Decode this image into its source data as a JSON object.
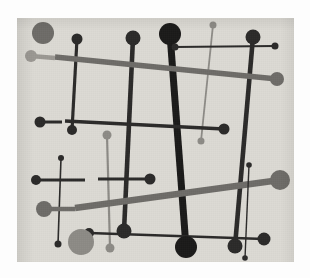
{
  "artwork": {
    "title": "Abstract Composition with Lines and Dots",
    "medium": "print reproduction",
    "style": "geometric-abstract",
    "canvas": {
      "x": 17,
      "y": 18,
      "width": 277,
      "height": 244,
      "background_color": "#dcdad4",
      "page_color": "#fdfdfd"
    },
    "palette": {
      "background": "#dcdad4",
      "dark": "#2b2a29",
      "black": "#1b1a19",
      "mid_gray": "#6e6c68",
      "light_gray": "#8d8b86",
      "pale_gray": "#9b9893",
      "page": "#fdfdfd"
    }
  },
  "chart_data": {
    "type": "scatter",
    "xlabel": "",
    "ylabel": "",
    "xlim": [
      0,
      277
    ],
    "ylim": [
      0,
      244
    ],
    "grid": false,
    "legend": null,
    "note": "Coordinates are in canvas space (origin at canvas top-left).",
    "strokes": [
      {
        "name": "thick-black-diagonal",
        "x1": 153,
        "y1": 16,
        "x2": 169,
        "y2": 229,
        "width": 7,
        "color": "#1b1a19",
        "cap_start": 11,
        "cap_end": 11
      },
      {
        "name": "dark-vertical-left",
        "x1": 60,
        "y1": 21,
        "x2": 55,
        "y2": 112,
        "width": 3.2,
        "color": "#2b2a29",
        "cap_start": 5.5,
        "cap_end": 5
      },
      {
        "name": "dark-vertical-center",
        "x1": 116,
        "y1": 20,
        "x2": 107,
        "y2": 213,
        "width": 4.6,
        "color": "#2b2a29",
        "cap_start": 7.5,
        "cap_end": 7.5
      },
      {
        "name": "dark-vertical-right",
        "x1": 236,
        "y1": 19,
        "x2": 218,
        "y2": 228,
        "width": 4.6,
        "color": "#2b2a29",
        "cap_start": 7.5,
        "cap_end": 7.5
      },
      {
        "name": "gray-vertical-tall",
        "x1": 196,
        "y1": 7,
        "x2": 184,
        "y2": 123,
        "width": 1.8,
        "color": "#8d8b86",
        "cap_start": 3.5,
        "cap_end": 3.5
      },
      {
        "name": "gray-vertical-lower",
        "x1": 90,
        "y1": 117,
        "x2": 93,
        "y2": 230,
        "width": 2.2,
        "color": "#8d8b86",
        "cap_start": 4.5,
        "cap_end": 4.5
      },
      {
        "name": "gray-diagonal-upper",
        "x1": 38,
        "y1": 39,
        "x2": 260,
        "y2": 61,
        "width": 5.5,
        "color": "#6e6c68",
        "cap_start": 0,
        "cap_end": 7
      },
      {
        "name": "gray-diagonal-lower",
        "x1": 58,
        "y1": 190,
        "x2": 263,
        "y2": 162,
        "width": 6.5,
        "color": "#6e6c68",
        "cap_start": 0,
        "cap_end": 10
      },
      {
        "name": "dark-horizontal-long",
        "x1": 48,
        "y1": 103,
        "x2": 207,
        "y2": 111,
        "width": 3.4,
        "color": "#2b2a29",
        "cap_start": 0,
        "cap_end": 5.5
      },
      {
        "name": "dark-horizontal-upper-right",
        "x1": 158,
        "y1": 29,
        "x2": 258,
        "y2": 28,
        "width": 2.0,
        "color": "#2b2a29",
        "cap_start": 3.5,
        "cap_end": 3.5
      },
      {
        "name": "dark-horizontal-left-short",
        "x1": 23,
        "y1": 104,
        "x2": 45,
        "y2": 104,
        "width": 3.0,
        "color": "#2b2a29",
        "cap_start": 5.5,
        "cap_end": 0
      },
      {
        "name": "dark-horizontal-mid-left",
        "x1": 19,
        "y1": 162,
        "x2": 68,
        "y2": 162,
        "width": 3.0,
        "color": "#2b2a29",
        "cap_start": 5,
        "cap_end": 0
      },
      {
        "name": "dark-horizontal-mid-right",
        "x1": 81,
        "y1": 161,
        "x2": 133,
        "y2": 161,
        "width": 3.0,
        "color": "#2b2a29",
        "cap_start": 0,
        "cap_end": 5.5
      },
      {
        "name": "dark-horizontal-lower",
        "x1": 72,
        "y1": 215,
        "x2": 247,
        "y2": 221,
        "width": 2.6,
        "color": "#2b2a29",
        "cap_start": 5,
        "cap_end": 6.5
      },
      {
        "name": "dark-vertical-thin-left",
        "x1": 44,
        "y1": 140,
        "x2": 41,
        "y2": 226,
        "width": 1.6,
        "color": "#2b2a29",
        "cap_start": 3,
        "cap_end": 3.5
      },
      {
        "name": "dark-vertical-thin-right",
        "x1": 232,
        "y1": 147,
        "x2": 228,
        "y2": 240,
        "width": 1.4,
        "color": "#2b2a29",
        "cap_start": 2.8,
        "cap_end": 2.8
      },
      {
        "name": "gray-stub-left-upper",
        "x1": 14,
        "y1": 38,
        "x2": 38,
        "y2": 40,
        "width": 4.5,
        "color": "#9b9893",
        "cap_start": 6,
        "cap_end": 0
      },
      {
        "name": "gray-stub-left-lower",
        "x1": 22,
        "y1": 191,
        "x2": 58,
        "y2": 191,
        "width": 4.5,
        "color": "#6e6c68",
        "cap_start": 0,
        "cap_end": 0
      }
    ],
    "dots": [
      {
        "name": "big-gray-circle-top-left",
        "cx": 26,
        "cy": 15,
        "r": 11,
        "color": "#6e6c68"
      },
      {
        "name": "gray-dot-left-upper",
        "cx": 14,
        "cy": 38,
        "r": 6,
        "color": "#9b9893"
      },
      {
        "name": "black-dot-vertical-left-top",
        "cx": 60,
        "cy": 21,
        "r": 5.5,
        "color": "#2b2a29"
      },
      {
        "name": "black-dot-vertical-left-bottom",
        "cx": 55,
        "cy": 112,
        "r": 5,
        "color": "#2b2a29"
      },
      {
        "name": "black-dot-center-top",
        "cx": 116,
        "cy": 20,
        "r": 7.5,
        "color": "#2b2a29"
      },
      {
        "name": "black-dot-center-bottom",
        "cx": 107,
        "cy": 213,
        "r": 7.5,
        "color": "#2b2a29"
      },
      {
        "name": "black-dot-thick-top",
        "cx": 153,
        "cy": 16,
        "r": 11,
        "color": "#1b1a19"
      },
      {
        "name": "black-dot-thick-bottom",
        "cx": 169,
        "cy": 229,
        "r": 11,
        "color": "#1b1a19"
      },
      {
        "name": "black-dot-right-top",
        "cx": 236,
        "cy": 19,
        "r": 7.5,
        "color": "#2b2a29"
      },
      {
        "name": "black-dot-right-bottom",
        "cx": 218,
        "cy": 228,
        "r": 7.5,
        "color": "#2b2a29"
      },
      {
        "name": "gray-dot-tall-top",
        "cx": 196,
        "cy": 7,
        "r": 3.5,
        "color": "#8d8b86"
      },
      {
        "name": "gray-dot-tall-bottom",
        "cx": 184,
        "cy": 123,
        "r": 3.5,
        "color": "#8d8b86"
      },
      {
        "name": "gray-dot-lower-top",
        "cx": 90,
        "cy": 117,
        "r": 4.5,
        "color": "#8d8b86"
      },
      {
        "name": "gray-dot-lower-bottom",
        "cx": 93,
        "cy": 230,
        "r": 4.5,
        "color": "#8d8b86"
      },
      {
        "name": "gray-dot-diagonal-upper-end",
        "cx": 260,
        "cy": 61,
        "r": 7,
        "color": "#6e6c68"
      },
      {
        "name": "gray-dot-diagonal-lower-end",
        "cx": 263,
        "cy": 162,
        "r": 10,
        "color": "#6e6c68"
      },
      {
        "name": "black-dot-horizontal-left",
        "cx": 23,
        "cy": 104,
        "r": 5.5,
        "color": "#2b2a29"
      },
      {
        "name": "black-dot-horizontal-right",
        "cx": 207,
        "cy": 111,
        "r": 5.5,
        "color": "#2b2a29"
      },
      {
        "name": "black-dot-upper-right-left",
        "cx": 158,
        "cy": 29,
        "r": 3.5,
        "color": "#2b2a29"
      },
      {
        "name": "black-dot-upper-right-right",
        "cx": 258,
        "cy": 28,
        "r": 3.5,
        "color": "#2b2a29"
      },
      {
        "name": "black-dot-midline-left",
        "cx": 19,
        "cy": 162,
        "r": 5,
        "color": "#2b2a29"
      },
      {
        "name": "black-dot-midline-right",
        "cx": 133,
        "cy": 161,
        "r": 5.5,
        "color": "#2b2a29"
      },
      {
        "name": "black-dot-lowerline-left",
        "cx": 72,
        "cy": 215,
        "r": 5,
        "color": "#2b2a29"
      },
      {
        "name": "black-dot-lowerline-right",
        "cx": 247,
        "cy": 221,
        "r": 6.5,
        "color": "#2b2a29"
      },
      {
        "name": "black-dot-thin-left-top",
        "cx": 44,
        "cy": 140,
        "r": 3,
        "color": "#2b2a29"
      },
      {
        "name": "black-dot-thin-left-bottom",
        "cx": 41,
        "cy": 226,
        "r": 3.5,
        "color": "#2b2a29"
      },
      {
        "name": "black-dot-thin-right-top",
        "cx": 232,
        "cy": 147,
        "r": 2.8,
        "color": "#2b2a29"
      },
      {
        "name": "black-dot-thin-right-bottom",
        "cx": 228,
        "cy": 240,
        "r": 2.8,
        "color": "#2b2a29"
      },
      {
        "name": "gray-circle-mid-left",
        "cx": 27,
        "cy": 191,
        "r": 8,
        "color": "#6e6c68"
      },
      {
        "name": "big-gray-circle-bottom",
        "cx": 64,
        "cy": 224,
        "r": 13,
        "color": "#8d8b86"
      }
    ]
  }
}
